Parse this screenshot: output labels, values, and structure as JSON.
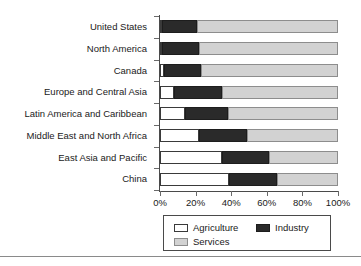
{
  "chart_data": {
    "type": "bar",
    "orientation": "horizontal",
    "stacked": true,
    "normalized_percent": true,
    "title": "",
    "xlabel": "",
    "ylabel": "",
    "xlim": [
      0,
      100
    ],
    "grid": false,
    "legend_position": "bottom",
    "categories": [
      "United States",
      "North America",
      "Canada",
      "Europe and Central Asia",
      "Latin America and Caribbean",
      "Middle East and North Africa",
      "East Asia and Pacific",
      "China"
    ],
    "tick_labels": [
      "0%",
      "20%",
      "40%",
      "60%",
      "80%",
      "100%"
    ],
    "tick_values": [
      0,
      20,
      40,
      60,
      80,
      100
    ],
    "series": [
      {
        "name": "Agriculture",
        "color": "#ffffff",
        "values": [
          1,
          1,
          2,
          8,
          14,
          22,
          35,
          39
        ]
      },
      {
        "name": "Industry",
        "color": "#2a2a2a",
        "values": [
          20,
          21,
          21,
          27,
          24,
          27,
          26,
          27
        ]
      },
      {
        "name": "Services",
        "color": "#d2d2d2",
        "values": [
          79,
          78,
          77,
          65,
          62,
          51,
          39,
          34
        ]
      }
    ]
  },
  "legend": {
    "items": [
      {
        "label": "Agriculture",
        "swatch": "agri"
      },
      {
        "label": "Industry",
        "swatch": "ind"
      },
      {
        "label": "Services",
        "swatch": "serv"
      }
    ]
  }
}
